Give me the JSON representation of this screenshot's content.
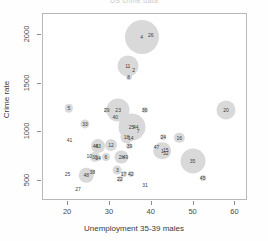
{
  "chart_data": {
    "type": "scatter",
    "title": "US crime data",
    "xlabel": "Unemployment 35-39 males",
    "ylabel": "Crime rate",
    "xlim": [
      14,
      63
    ],
    "ylim": [
      290,
      2220
    ],
    "xticks": [
      20,
      30,
      40,
      50,
      60
    ],
    "yticks": [
      500,
      1000,
      1500,
      2000
    ],
    "grid": false,
    "legend": null,
    "bubble_color": "#d9d9d9",
    "note": "Bubble area encodes a third variable; point labels are observation numbers",
    "points": [
      {
        "label": "4",
        "x": 37.8,
        "y": 1969,
        "r": 17.0
      },
      {
        "label": "26",
        "x": 40.0,
        "y": 1993,
        "r": 3.2
      },
      {
        "label": "11",
        "x": 34.5,
        "y": 1674,
        "r": 10.5
      },
      {
        "label": "2",
        "x": 35.9,
        "y": 1635,
        "r": 3.0
      },
      {
        "label": "8",
        "x": 34.7,
        "y": 1555,
        "r": 3.0
      },
      {
        "label": "5",
        "x": 20.4,
        "y": 1235,
        "r": 4.2
      },
      {
        "label": "29",
        "x": 29.5,
        "y": 1216,
        "r": 3.0
      },
      {
        "label": "23",
        "x": 32.2,
        "y": 1216,
        "r": 11.5
      },
      {
        "label": "40",
        "x": 31.5,
        "y": 1150,
        "r": 3.0
      },
      {
        "label": "36",
        "x": 38.5,
        "y": 1223,
        "r": 3.0
      },
      {
        "label": "20",
        "x": 58.0,
        "y": 1216,
        "r": 9.5
      },
      {
        "label": "33",
        "x": 24.3,
        "y": 1072,
        "r": 4.6
      },
      {
        "label": "25",
        "x": 35.4,
        "y": 1048,
        "r": 13.5
      },
      {
        "label": "44",
        "x": 36.4,
        "y": 1040,
        "r": 3.0
      },
      {
        "label": "7",
        "x": 37.0,
        "y": 1003,
        "r": 3.0
      },
      {
        "label": "41",
        "x": 20.6,
        "y": 910,
        "r": 2.6
      },
      {
        "label": "18",
        "x": 34.2,
        "y": 940,
        "r": 6.6
      },
      {
        "label": "14",
        "x": 35.2,
        "y": 935,
        "r": 3.0
      },
      {
        "label": "24",
        "x": 43.0,
        "y": 940,
        "r": 3.0
      },
      {
        "label": "16",
        "x": 46.8,
        "y": 930,
        "r": 5.2
      },
      {
        "label": "43",
        "x": 27.4,
        "y": 850,
        "r": 7.0
      },
      {
        "label": "46",
        "x": 26.8,
        "y": 850,
        "r": 3.0
      },
      {
        "label": "12",
        "x": 30.5,
        "y": 855,
        "r": 6.0
      },
      {
        "label": "39",
        "x": 34.9,
        "y": 845,
        "r": 3.0
      },
      {
        "label": "47",
        "x": 41.4,
        "y": 840,
        "r": 2.6
      },
      {
        "label": "1",
        "x": 42.8,
        "y": 800,
        "r": 8.8
      },
      {
        "label": "15",
        "x": 43.6,
        "y": 810,
        "r": 3.0
      },
      {
        "label": "32",
        "x": 43.6,
        "y": 775,
        "r": 3.0
      },
      {
        "label": "10",
        "x": 25.3,
        "y": 740,
        "r": 2.6
      },
      {
        "label": "30",
        "x": 26.6,
        "y": 730,
        "r": 5.0
      },
      {
        "label": "34",
        "x": 27.4,
        "y": 720,
        "r": 3.0
      },
      {
        "label": "6",
        "x": 29.3,
        "y": 730,
        "r": 4.0
      },
      {
        "label": "2b",
        "x": 33.0,
        "y": 735,
        "r": 6.6
      },
      {
        "label": "49",
        "x": 33.9,
        "y": 730,
        "r": 3.0
      },
      {
        "label": "35",
        "x": 50.0,
        "y": 690,
        "r": 12.5
      },
      {
        "label": "25",
        "x": 20.1,
        "y": 560,
        "r": 2.6
      },
      {
        "label": "48",
        "x": 24.6,
        "y": 545,
        "r": 7.2
      },
      {
        "label": "38",
        "x": 26.0,
        "y": 580,
        "r": 3.0
      },
      {
        "label": "3",
        "x": 32.0,
        "y": 595,
        "r": 4.4
      },
      {
        "label": "17",
        "x": 33.5,
        "y": 555,
        "r": 3.0
      },
      {
        "label": "42",
        "x": 35.2,
        "y": 555,
        "r": 3.0
      },
      {
        "label": "22",
        "x": 32.6,
        "y": 505,
        "r": 3.0
      },
      {
        "label": "45",
        "x": 52.4,
        "y": 520,
        "r": 3.0
      },
      {
        "label": "31",
        "x": 38.6,
        "y": 445,
        "r": 2.4
      },
      {
        "label": "27",
        "x": 22.6,
        "y": 400,
        "r": 2.4
      }
    ]
  }
}
